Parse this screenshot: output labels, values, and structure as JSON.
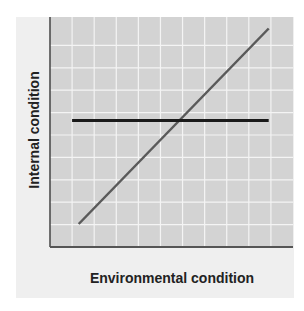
{
  "chart_data": {
    "type": "line",
    "title": "",
    "xlabel": "Environmental condition",
    "ylabel": "Internal condition",
    "grid": true,
    "xlim": [
      0,
      11
    ],
    "ylim": [
      0,
      10
    ],
    "series": [
      {
        "name": "conformer",
        "color": "#5a5a5a",
        "x": [
          1.3,
          9.9
        ],
        "y": [
          1.0,
          9.5
        ]
      },
      {
        "name": "regulator",
        "color": "#1a1a1a",
        "x": [
          1.0,
          9.9
        ],
        "y": [
          5.5,
          5.5
        ]
      }
    ],
    "legend": null
  },
  "labels": {
    "x_axis": "Environmental condition",
    "y_axis": "Internal condition"
  },
  "colors": {
    "panel": "#efefef",
    "plot_bg": "#d3d3d3",
    "grid": "#f4f4f4",
    "axis": "#444444",
    "diagonal": "#5a5a5a",
    "horizontal": "#1a1a1a"
  }
}
